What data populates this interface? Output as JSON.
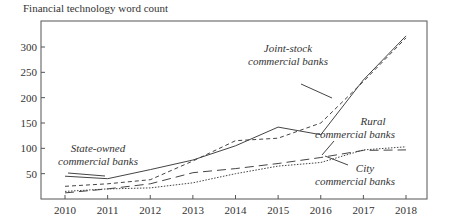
{
  "chart_data": {
    "type": "line",
    "title": "Financial technology word count",
    "xlabel": "",
    "ylabel": "Financial technology word count",
    "x": [
      2010,
      2011,
      2012,
      2013,
      2014,
      2015,
      2016,
      2017,
      2018
    ],
    "ylim": [
      0,
      345
    ],
    "yticks": [
      50,
      100,
      150,
      200,
      250,
      300
    ],
    "grid": false,
    "legend": "inline annotations",
    "series": [
      {
        "name": "State-owned commercial banks",
        "style": "solid",
        "values": [
          45,
          40,
          58,
          77,
          105,
          142,
          127,
          235,
          322
        ]
      },
      {
        "name": "Joint-stock commercial banks",
        "style": "short-dash",
        "values": [
          25,
          30,
          38,
          75,
          115,
          120,
          150,
          232,
          318
        ]
      },
      {
        "name": "Rural commercial banks",
        "style": "long-dash",
        "values": [
          12,
          20,
          30,
          52,
          60,
          70,
          82,
          96,
          97
        ]
      },
      {
        "name": "City commercial banks",
        "style": "dotted",
        "values": [
          15,
          20,
          22,
          32,
          50,
          65,
          72,
          97,
          103
        ]
      }
    ],
    "annotations": [
      {
        "lines": [
          "State-owned",
          "commercial banks"
        ]
      },
      {
        "lines": [
          "Joint-stock",
          "commercial banks"
        ]
      },
      {
        "lines": [
          "Rural",
          "commercial banks"
        ]
      },
      {
        "lines": [
          "City",
          "commercial banks"
        ]
      }
    ]
  }
}
